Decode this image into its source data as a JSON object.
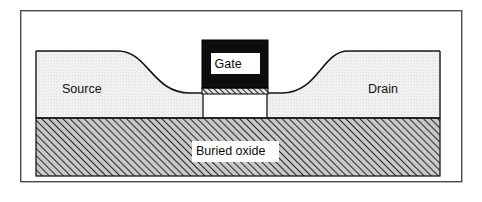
{
  "figure": {
    "kind": "cross-section-diagram",
    "background_color": "#ffffff",
    "frame": {
      "name": "outer-border",
      "x": 20,
      "y": 10,
      "width": 442,
      "height": 172,
      "stroke_color": "#4a4a4a",
      "fill_color": "#ffffff",
      "stroke_width": 1.4
    }
  },
  "layers": {
    "silicon": {
      "label": "silicon-film",
      "fill_color": "#f1f1f1",
      "stroke_color": "#1a1a1a",
      "texture": "fine-stipple",
      "left_edge_x": 36,
      "right_edge_x": 440,
      "top_y": 51,
      "bottom_y": 118
    },
    "buried_oxide": {
      "label": "Buried oxide",
      "fill_color": "#c9c9c9",
      "hatch_color": "#2b2b2b",
      "stroke_color": "#1a1a1a",
      "texture": "diagonal-hatch-45",
      "x": 36,
      "y": 118,
      "width": 404,
      "height": 58
    },
    "gate": {
      "label": "Gate",
      "fill_color": "#0d0d0d",
      "stroke_color": "#000000",
      "x": 202,
      "y": 40,
      "width": 66,
      "height": 48
    },
    "gate_oxide": {
      "label": "gate-oxide",
      "fill_color": "#d9d9d9",
      "hatch_color": "#1a1a1a",
      "texture": "diagonal-hatch-45",
      "x": 202,
      "y": 88,
      "width": 66,
      "height": 6
    },
    "channel": {
      "label": "channel-region",
      "fill_color": "#ffffff",
      "stroke_color": "#1a1a1a",
      "left_edge_x": 203,
      "right_edge_x": 267,
      "top_y": 94,
      "bottom_y": 118
    }
  },
  "labels": {
    "source": {
      "text": "Source",
      "x": 62,
      "y": 90,
      "boxed": false
    },
    "drain": {
      "text": "Drain",
      "x": 368,
      "y": 90,
      "boxed": false
    },
    "gate": {
      "text": "Gate",
      "x": 214,
      "y": 64,
      "boxed": true,
      "box_fill": "#ffffff"
    },
    "buried_oxide": {
      "text": "Buried oxide",
      "x": 196,
      "y": 151,
      "boxed": true,
      "box_fill": "#ffffff"
    }
  },
  "geometry": {
    "source_slope": {
      "start_x": 36,
      "plateau_end_x": 118,
      "descent_end_x": 190,
      "top_y": 51,
      "bottom_y": 93
    },
    "drain_slope": {
      "ascent_start_x": 282,
      "ascent_end_x": 348,
      "end_x": 440,
      "top_y": 51,
      "bottom_y": 93
    }
  }
}
